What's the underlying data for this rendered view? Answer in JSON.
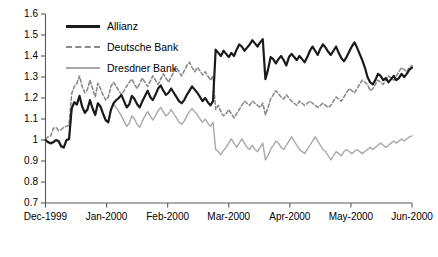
{
  "chart_data": {
    "type": "line",
    "title": "",
    "xlabel": "",
    "ylabel": "",
    "ylim": [
      0.7,
      1.6
    ],
    "ytick_labels": [
      "1.6",
      "1.5",
      "1.4",
      "1.3",
      "1.2",
      "1.1",
      "1",
      "0.9",
      "0.8",
      "0.7"
    ],
    "ytick_values": [
      1.6,
      1.5,
      1.4,
      1.3,
      1.2,
      1.1,
      1.0,
      0.9,
      0.8,
      0.7
    ],
    "xtick_labels": [
      "Dec-1999",
      "Jan-2000",
      "Feb-2000",
      "Mar-2000",
      "Apr-2000",
      "May-2000",
      "Jun-2000"
    ],
    "xtick_values": [
      0,
      21,
      42,
      63,
      84,
      105,
      126
    ],
    "xlim": [
      0,
      126
    ],
    "grid": false,
    "legend_position": "top-left",
    "series": [
      {
        "name": "Allianz",
        "color": "#1a1a1a",
        "style": "solid",
        "width": 2.2,
        "values": [
          1.0,
          0.99,
          0.985,
          0.99,
          1.0,
          0.995,
          0.97,
          0.965,
          1.0,
          1.005,
          1.15,
          1.18,
          1.17,
          1.21,
          1.16,
          1.13,
          1.145,
          1.19,
          1.15,
          1.12,
          1.175,
          1.16,
          1.125,
          1.095,
          1.085,
          1.145,
          1.175,
          1.19,
          1.2,
          1.215,
          1.185,
          1.155,
          1.17,
          1.21,
          1.195,
          1.17,
          1.155,
          1.185,
          1.21,
          1.235,
          1.205,
          1.19,
          1.215,
          1.245,
          1.26,
          1.235,
          1.215,
          1.225,
          1.245,
          1.225,
          1.205,
          1.185,
          1.175,
          1.19,
          1.215,
          1.235,
          1.255,
          1.24,
          1.225,
          1.205,
          1.185,
          1.2,
          1.18,
          1.165,
          1.185,
          1.43,
          1.415,
          1.4,
          1.425,
          1.41,
          1.395,
          1.415,
          1.4,
          1.43,
          1.455,
          1.445,
          1.425,
          1.44,
          1.455,
          1.475,
          1.46,
          1.445,
          1.465,
          1.48,
          1.29,
          1.335,
          1.395,
          1.385,
          1.365,
          1.385,
          1.4,
          1.38,
          1.355,
          1.395,
          1.41,
          1.395,
          1.38,
          1.4,
          1.385,
          1.37,
          1.395,
          1.425,
          1.445,
          1.425,
          1.405,
          1.435,
          1.455,
          1.44,
          1.42,
          1.405,
          1.425,
          1.445,
          1.415,
          1.39,
          1.375,
          1.395,
          1.42,
          1.445,
          1.465,
          1.44,
          1.41,
          1.38,
          1.345,
          1.3,
          1.275,
          1.265,
          1.285,
          1.315,
          1.305,
          1.285,
          1.295,
          1.275,
          1.29,
          1.305,
          1.285,
          1.295,
          1.315,
          1.3,
          1.315,
          1.335,
          1.345
        ]
      },
      {
        "name": "Deutsche Bank",
        "color": "#8a8a8a",
        "style": "dashed",
        "width": 1.6,
        "values": [
          1.005,
          1.015,
          1.02,
          1.055,
          1.06,
          1.045,
          1.05,
          1.06,
          1.065,
          1.07,
          1.22,
          1.255,
          1.27,
          1.305,
          1.255,
          1.225,
          1.24,
          1.285,
          1.245,
          1.205,
          1.27,
          1.245,
          1.215,
          1.19,
          1.205,
          1.255,
          1.275,
          1.255,
          1.235,
          1.215,
          1.235,
          1.255,
          1.275,
          1.29,
          1.265,
          1.245,
          1.27,
          1.295,
          1.275,
          1.255,
          1.28,
          1.305,
          1.285,
          1.265,
          1.29,
          1.315,
          1.295,
          1.275,
          1.3,
          1.325,
          1.345,
          1.325,
          1.305,
          1.33,
          1.355,
          1.37,
          1.345,
          1.325,
          1.345,
          1.33,
          1.31,
          1.325,
          1.305,
          1.285,
          1.305,
          1.145,
          1.165,
          1.135,
          1.115,
          1.125,
          1.145,
          1.125,
          1.105,
          1.125,
          1.145,
          1.165,
          1.185,
          1.175,
          1.165,
          1.185,
          1.175,
          1.165,
          1.155,
          1.175,
          1.12,
          1.155,
          1.195,
          1.215,
          1.235,
          1.22,
          1.205,
          1.195,
          1.215,
          1.2,
          1.185,
          1.175,
          1.165,
          1.185,
          1.175,
          1.165,
          1.175,
          1.185,
          1.175,
          1.165,
          1.155,
          1.165,
          1.175,
          1.165,
          1.155,
          1.165,
          1.185,
          1.205,
          1.195,
          1.185,
          1.205,
          1.225,
          1.245,
          1.235,
          1.225,
          1.245,
          1.265,
          1.285,
          1.275,
          1.265,
          1.235,
          1.245,
          1.265,
          1.285,
          1.275,
          1.265,
          1.285,
          1.305,
          1.295,
          1.285,
          1.305,
          1.325,
          1.345,
          1.335,
          1.325,
          1.345,
          1.355
        ]
      },
      {
        "name": "Dresdner Bank",
        "color": "#a8a8a8",
        "style": "solid",
        "width": 1.4,
        "values": [
          0.995,
          0.985,
          0.98,
          0.985,
          0.995,
          0.99,
          0.965,
          0.96,
          0.995,
          1.0,
          1.145,
          1.175,
          1.165,
          1.205,
          1.155,
          1.125,
          1.14,
          1.185,
          1.145,
          1.115,
          1.17,
          1.155,
          1.12,
          1.09,
          1.08,
          1.14,
          1.17,
          1.155,
          1.135,
          1.115,
          1.09,
          1.065,
          1.08,
          1.115,
          1.1,
          1.075,
          1.06,
          1.09,
          1.115,
          1.135,
          1.115,
          1.095,
          1.115,
          1.14,
          1.155,
          1.135,
          1.115,
          1.125,
          1.145,
          1.125,
          1.105,
          1.085,
          1.075,
          1.09,
          1.115,
          1.135,
          1.15,
          1.135,
          1.12,
          1.1,
          1.085,
          1.1,
          1.08,
          1.065,
          1.085,
          0.955,
          0.945,
          0.93,
          0.95,
          0.965,
          0.985,
          1.005,
          0.985,
          0.965,
          0.985,
          1.005,
          0.985,
          0.965,
          0.955,
          0.975,
          0.955,
          0.945,
          0.965,
          0.985,
          0.905,
          0.925,
          0.955,
          0.975,
          0.995,
          0.985,
          0.965,
          0.955,
          0.975,
          0.995,
          1.015,
          0.995,
          0.975,
          0.955,
          0.945,
          0.935,
          0.955,
          0.975,
          0.995,
          1.015,
          0.995,
          0.975,
          0.955,
          0.945,
          0.925,
          0.905,
          0.925,
          0.945,
          0.935,
          0.925,
          0.945,
          0.955,
          0.945,
          0.935,
          0.945,
          0.955,
          0.945,
          0.935,
          0.945,
          0.955,
          0.965,
          0.955,
          0.965,
          0.975,
          0.985,
          0.975,
          0.965,
          0.975,
          0.985,
          0.995,
          0.985,
          0.995,
          1.005,
          0.995,
          1.005,
          1.015,
          1.02
        ]
      }
    ]
  },
  "legend": {
    "items": [
      {
        "label": "Allianz"
      },
      {
        "label": "Deutsche Bank"
      },
      {
        "label": "Dresdner Bank"
      }
    ]
  }
}
